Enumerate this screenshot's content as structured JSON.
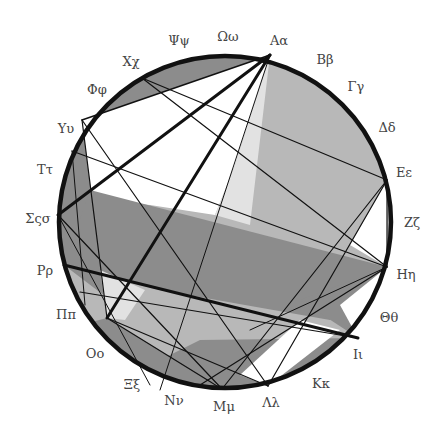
{
  "diagram": {
    "type": "circle-chord-diagram",
    "colors": {
      "background": "#ffffff",
      "light_fill": "#b8b8b8",
      "mid_fill": "#8c8c8c",
      "pale_fill": "#e2e2e2",
      "line": "#111111"
    },
    "labels": [
      {
        "id": "alpha",
        "text": "Aα",
        "x": 279,
        "y": 40
      },
      {
        "id": "beta",
        "text": "Ββ",
        "x": 325,
        "y": 59
      },
      {
        "id": "gamma",
        "text": "Γγ",
        "x": 356,
        "y": 86
      },
      {
        "id": "delta",
        "text": "Δδ",
        "x": 387,
        "y": 127
      },
      {
        "id": "epsilon",
        "text": "Εε",
        "x": 404,
        "y": 172
      },
      {
        "id": "zeta",
        "text": "Ζζ",
        "x": 412,
        "y": 222
      },
      {
        "id": "eta",
        "text": "Ηη",
        "x": 406,
        "y": 274
      },
      {
        "id": "theta",
        "text": "Θθ",
        "x": 389,
        "y": 317
      },
      {
        "id": "iota",
        "text": "Ιι",
        "x": 358,
        "y": 354
      },
      {
        "id": "kappa",
        "text": "Κκ",
        "x": 321,
        "y": 383
      },
      {
        "id": "lambda",
        "text": "Λλ",
        "x": 271,
        "y": 402
      },
      {
        "id": "mu",
        "text": "Μμ",
        "x": 224,
        "y": 406
      },
      {
        "id": "nu",
        "text": "Νν",
        "x": 174,
        "y": 400
      },
      {
        "id": "xi",
        "text": "Ξξ",
        "x": 132,
        "y": 384
      },
      {
        "id": "omicron",
        "text": "Οο",
        "x": 95,
        "y": 353
      },
      {
        "id": "pi",
        "text": "Ππ",
        "x": 66,
        "y": 314
      },
      {
        "id": "rho",
        "text": "Ρρ",
        "x": 45,
        "y": 270
      },
      {
        "id": "sigma",
        "text": "Σςσ",
        "x": 38,
        "y": 218
      },
      {
        "id": "tau",
        "text": "Ττ",
        "x": 45,
        "y": 169
      },
      {
        "id": "upsilon",
        "text": "Υυ",
        "x": 66,
        "y": 128
      },
      {
        "id": "phi",
        "text": "Φφ",
        "x": 97,
        "y": 89
      },
      {
        "id": "chi",
        "text": "Χχ",
        "x": 131,
        "y": 61
      },
      {
        "id": "psi",
        "text": "Ψψ",
        "x": 179,
        "y": 40
      },
      {
        "id": "omega",
        "text": "Ωω",
        "x": 228,
        "y": 36
      }
    ]
  }
}
